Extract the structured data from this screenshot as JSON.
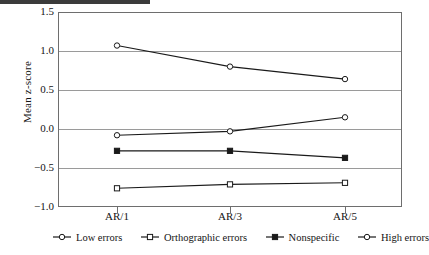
{
  "chart_data": {
    "type": "line",
    "title": "",
    "xlabel": "",
    "ylabel": "Mean z-score",
    "categories": [
      "AR/1",
      "AR/3",
      "AR/5"
    ],
    "ylim": [
      -1.0,
      1.5
    ],
    "yticks": [
      "1.5",
      "1.0",
      "0.5",
      "0.0",
      "-0.5",
      "-1.0"
    ],
    "ytick_values": [
      1.5,
      1.0,
      0.5,
      0.0,
      -0.5,
      -1.0
    ],
    "grid": true,
    "legend_position": "bottom",
    "series": [
      {
        "name": "Low errors",
        "marker": "open-circle",
        "color": "#1a1a1a",
        "values": [
          -0.08,
          -0.03,
          0.15
        ]
      },
      {
        "name": "Orthographic errors",
        "marker": "open-square",
        "color": "#1a1a1a",
        "values": [
          -0.76,
          -0.71,
          -0.69
        ]
      },
      {
        "name": "Nonspecific",
        "marker": "filled-square",
        "color": "#1a1a1a",
        "values": [
          -0.28,
          -0.28,
          -0.37
        ]
      },
      {
        "name": "High errors",
        "marker": "open-circle",
        "color": "#1a1a1a",
        "values": [
          1.07,
          0.8,
          0.64
        ]
      }
    ]
  }
}
